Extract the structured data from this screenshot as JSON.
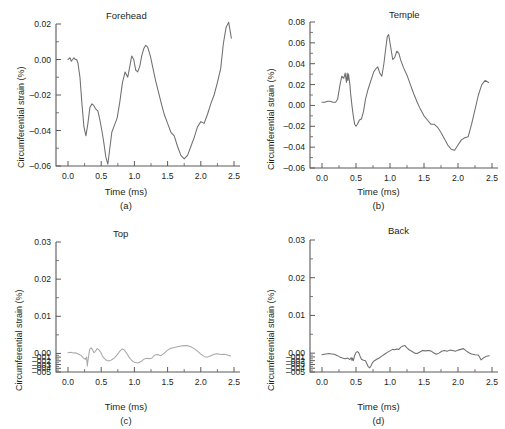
{
  "figure": {
    "panel_count": 4,
    "background": "#ffffff",
    "ink": "#231f20"
  },
  "chart_data": [
    {
      "type": "line",
      "title": "Forehead",
      "caption": "(a)",
      "xlabel": "Time (ms)",
      "ylabel": "Circumferential strain (%)",
      "xlim": [
        0.0,
        2.5
      ],
      "ylim": [
        -0.06,
        0.02
      ],
      "xticks": [
        0.0,
        0.5,
        1.0,
        1.5,
        2.0,
        2.5
      ],
      "xticklabels": [
        "0.0",
        "0.5",
        "1.0",
        "1.5",
        "2.0",
        "2.5"
      ],
      "yticks": [
        0.02,
        0.0,
        -0.02,
        -0.04,
        -0.06
      ],
      "yticklabels": [
        "0.02",
        "0.00",
        "–0.02",
        "–0.04",
        "–0.06"
      ],
      "minor_ticks": true,
      "grid": false,
      "legend": null,
      "line_color": "#6f6f6f",
      "x": [
        0.0,
        0.03,
        0.05,
        0.07,
        0.09,
        0.11,
        0.13,
        0.15,
        0.18,
        0.21,
        0.24,
        0.27,
        0.3,
        0.33,
        0.36,
        0.39,
        0.42,
        0.45,
        0.48,
        0.51,
        0.54,
        0.57,
        0.6,
        0.63,
        0.66,
        0.7,
        0.74,
        0.78,
        0.82,
        0.86,
        0.9,
        0.93,
        0.96,
        0.99,
        1.02,
        1.05,
        1.08,
        1.11,
        1.14,
        1.17,
        1.2,
        1.24,
        1.28,
        1.32,
        1.36,
        1.4,
        1.45,
        1.5,
        1.55,
        1.6,
        1.65,
        1.7,
        1.75,
        1.8,
        1.85,
        1.9,
        1.95,
        2.0,
        2.05,
        2.1,
        2.15,
        2.2,
        2.25,
        2.3,
        2.34,
        2.38,
        2.42,
        2.46
      ],
      "y": [
        0.0,
        0.001,
        -0.001,
        0.0,
        0.001,
        0.0,
        0.0,
        -0.002,
        -0.01,
        -0.025,
        -0.038,
        -0.043,
        -0.036,
        -0.027,
        -0.025,
        -0.026,
        -0.028,
        -0.029,
        -0.034,
        -0.04,
        -0.047,
        -0.055,
        -0.059,
        -0.05,
        -0.041,
        -0.037,
        -0.033,
        -0.024,
        -0.013,
        -0.007,
        -0.01,
        -0.004,
        0.002,
        0.0,
        -0.006,
        -0.007,
        -0.004,
        0.002,
        0.006,
        0.008,
        0.007,
        0.002,
        -0.005,
        -0.012,
        -0.018,
        -0.024,
        -0.031,
        -0.036,
        -0.041,
        -0.043,
        -0.049,
        -0.054,
        -0.056,
        -0.054,
        -0.049,
        -0.044,
        -0.038,
        -0.035,
        -0.036,
        -0.031,
        -0.025,
        -0.02,
        -0.013,
        -0.005,
        0.009,
        0.018,
        0.021,
        0.012
      ]
    },
    {
      "type": "line",
      "title": "Temple",
      "caption": "(b)",
      "xlabel": "Time (ms)",
      "ylabel": "Circumferential strain (%)",
      "xlim": [
        0.0,
        2.5
      ],
      "ylim": [
        -0.06,
        0.08
      ],
      "xticks": [
        0.0,
        0.5,
        1.0,
        1.5,
        2.0,
        2.5
      ],
      "xticklabels": [
        "0.0",
        "0.5",
        "1.0",
        "1.5",
        "2.0",
        "2.5"
      ],
      "yticks": [
        0.08,
        0.06,
        0.04,
        0.02,
        0.0,
        -0.02,
        -0.04,
        -0.06
      ],
      "yticklabels": [
        "0.08",
        "0.06",
        "0.04",
        "0.02",
        "0.00",
        "–0.02",
        "–0.04",
        "–0.06"
      ],
      "minor_ticks": true,
      "grid": false,
      "legend": null,
      "line_color": "#6f6f6f",
      "x": [
        0.0,
        0.04,
        0.08,
        0.12,
        0.16,
        0.2,
        0.23,
        0.26,
        0.29,
        0.32,
        0.34,
        0.36,
        0.37,
        0.38,
        0.39,
        0.4,
        0.41,
        0.42,
        0.44,
        0.46,
        0.48,
        0.5,
        0.52,
        0.55,
        0.58,
        0.61,
        0.64,
        0.68,
        0.72,
        0.76,
        0.79,
        0.82,
        0.85,
        0.88,
        0.91,
        0.94,
        0.96,
        0.98,
        1.01,
        1.04,
        1.07,
        1.1,
        1.13,
        1.16,
        1.2,
        1.25,
        1.3,
        1.35,
        1.4,
        1.45,
        1.5,
        1.55,
        1.6,
        1.65,
        1.7,
        1.75,
        1.8,
        1.85,
        1.9,
        1.95,
        2.0,
        2.05,
        2.1,
        2.15,
        2.2,
        2.25,
        2.3,
        2.35,
        2.4,
        2.45
      ],
      "y": [
        0.003,
        0.003,
        0.004,
        0.004,
        0.003,
        0.003,
        0.006,
        0.018,
        0.028,
        0.026,
        0.031,
        0.022,
        0.031,
        0.024,
        0.03,
        0.025,
        0.02,
        0.012,
        0.0,
        -0.01,
        -0.018,
        -0.02,
        -0.018,
        -0.014,
        -0.013,
        -0.006,
        0.006,
        0.016,
        0.024,
        0.032,
        0.035,
        0.037,
        0.031,
        0.028,
        0.04,
        0.056,
        0.066,
        0.068,
        0.056,
        0.044,
        0.046,
        0.052,
        0.05,
        0.043,
        0.036,
        0.029,
        0.02,
        0.011,
        0.003,
        -0.004,
        -0.01,
        -0.014,
        -0.018,
        -0.018,
        -0.021,
        -0.026,
        -0.032,
        -0.038,
        -0.042,
        -0.043,
        -0.038,
        -0.033,
        -0.031,
        -0.03,
        -0.018,
        -0.004,
        0.01,
        0.02,
        0.024,
        0.022
      ]
    },
    {
      "type": "line",
      "title": "Top",
      "caption": "(c)",
      "xlabel": "Time (ms)",
      "ylabel": "Circumferential strain (%)",
      "xlim": [
        0.0,
        2.5
      ],
      "ylim": [
        -0.005,
        0.03
      ],
      "xticks": [
        0.0,
        0.5,
        1.0,
        1.5,
        2.0,
        2.5
      ],
      "xticklabels": [
        "0.0",
        "0.5",
        "1.0",
        "1.5",
        "2.0",
        "2.5"
      ],
      "yticks": [
        0.03,
        0.02,
        0.01,
        0.0,
        -0.001,
        -0.002,
        -0.003,
        -0.004,
        -0.005
      ],
      "yticklabels": [
        "0.03",
        "0.02",
        "0.01",
        "0.00",
        "–001",
        "–002",
        "–003",
        "–004",
        "–005"
      ],
      "minor_ticks": true,
      "grid": false,
      "legend": null,
      "line_color": "#a8a8a8",
      "x": [
        0.0,
        0.04,
        0.08,
        0.11,
        0.14,
        0.17,
        0.2,
        0.23,
        0.26,
        0.28,
        0.29,
        0.3,
        0.31,
        0.32,
        0.33,
        0.35,
        0.37,
        0.39,
        0.41,
        0.44,
        0.47,
        0.5,
        0.52,
        0.55,
        0.58,
        0.62,
        0.66,
        0.7,
        0.74,
        0.78,
        0.82,
        0.85,
        0.88,
        0.92,
        0.96,
        1.0,
        1.05,
        1.1,
        1.14,
        1.18,
        1.22,
        1.26,
        1.3,
        1.35,
        1.4,
        1.45,
        1.5,
        1.55,
        1.6,
        1.65,
        1.7,
        1.75,
        1.8,
        1.85,
        1.9,
        1.95,
        2.0,
        2.05,
        2.1,
        2.15,
        2.2,
        2.25,
        2.3,
        2.35,
        2.4,
        2.45
      ],
      "y": [
        0.0002,
        0.0003,
        0.0001,
        0.0002,
        0.0,
        -0.0003,
        -0.0006,
        -0.0012,
        -0.0016,
        -0.001,
        -0.0034,
        -0.002,
        -0.0008,
        0.0004,
        0.0012,
        0.0015,
        0.001,
        0.0002,
        0.0005,
        0.0013,
        0.0009,
        0.0001,
        -0.0008,
        -0.0014,
        -0.0019,
        -0.002,
        -0.0017,
        -0.0012,
        -0.0004,
        0.0006,
        0.0012,
        0.0009,
        0.0001,
        -0.001,
        -0.0019,
        -0.0024,
        -0.0026,
        -0.0022,
        -0.0016,
        -0.0013,
        -0.0014,
        -0.0013,
        -0.0005,
        -0.0003,
        -0.0006,
        0.0001,
        0.0009,
        0.0014,
        0.0016,
        0.0018,
        0.002,
        0.0021,
        0.0021,
        0.0018,
        0.0013,
        0.0006,
        -0.0002,
        -0.0008,
        -0.001,
        -0.0006,
        -0.0002,
        -0.0001,
        -0.0003,
        -0.0002,
        -0.0004,
        -0.0007
      ]
    },
    {
      "type": "line",
      "title": "Back",
      "caption": "(d)",
      "xlabel": "Time (ms)",
      "ylabel": "Circumferential strain (%)",
      "xlim": [
        0.0,
        2.5
      ],
      "ylim": [
        -0.005,
        0.03
      ],
      "xticks": [
        0.0,
        0.5,
        1.0,
        1.5,
        2.0,
        2.5
      ],
      "xticklabels": [
        "0.0",
        "0.5",
        "1.0",
        "1.5",
        "2.0",
        "2.5"
      ],
      "yticks": [
        0.03,
        0.02,
        0.01,
        0.0,
        -0.001,
        -0.002,
        -0.003,
        -0.004,
        -0.005
      ],
      "yticklabels": [
        "0.03",
        "0.02",
        "0.01",
        "0.00",
        "–001",
        "–002",
        "–003",
        "–004",
        "–005"
      ],
      "minor_ticks": true,
      "grid": false,
      "legend": null,
      "line_color": "#6f6f6f",
      "x": [
        0.0,
        0.03,
        0.06,
        0.1,
        0.14,
        0.18,
        0.22,
        0.26,
        0.3,
        0.34,
        0.38,
        0.41,
        0.43,
        0.44,
        0.45,
        0.46,
        0.47,
        0.48,
        0.5,
        0.52,
        0.54,
        0.56,
        0.58,
        0.61,
        0.64,
        0.66,
        0.68,
        0.7,
        0.72,
        0.74,
        0.77,
        0.8,
        0.84,
        0.88,
        0.92,
        0.96,
        1.0,
        1.04,
        1.07,
        1.1,
        1.13,
        1.16,
        1.19,
        1.22,
        1.25,
        1.28,
        1.32,
        1.36,
        1.4,
        1.44,
        1.48,
        1.52,
        1.56,
        1.6,
        1.64,
        1.68,
        1.72,
        1.76,
        1.8,
        1.84,
        1.88,
        1.92,
        1.96,
        2.0,
        2.04,
        2.08,
        2.12,
        2.16,
        2.2,
        2.25,
        2.3,
        2.34,
        2.38,
        2.42,
        2.46
      ],
      "y": [
        -0.0004,
        -0.0003,
        -0.0002,
        -0.0001,
        -0.0002,
        -0.0003,
        -0.0006,
        -0.001,
        -0.0013,
        -0.0015,
        -0.0013,
        -0.0017,
        -0.0012,
        -0.0019,
        -0.0013,
        -0.002,
        -0.0014,
        -0.0006,
        0.0002,
        0.0004,
        0.0001,
        -0.0008,
        -0.0016,
        -0.0019,
        -0.002,
        -0.0028,
        -0.0036,
        -0.0039,
        -0.0034,
        -0.0026,
        -0.002,
        -0.0017,
        -0.0013,
        -0.0008,
        -0.0003,
        0.0002,
        0.0006,
        0.001,
        0.0009,
        0.0011,
        0.001,
        0.0016,
        0.0019,
        0.002,
        0.0014,
        0.0009,
        0.0005,
        0.0,
        -0.0001,
        0.0003,
        0.0007,
        0.0006,
        0.0007,
        0.0006,
        0.0001,
        -0.0003,
        0.0,
        0.0005,
        0.0007,
        0.0005,
        0.0008,
        0.0007,
        0.0005,
        0.0008,
        0.001,
        0.0012,
        0.0006,
        0.0001,
        -0.0002,
        -0.0004,
        -0.0005,
        -0.0018,
        -0.0012,
        -0.0008,
        -0.0007
      ]
    }
  ]
}
